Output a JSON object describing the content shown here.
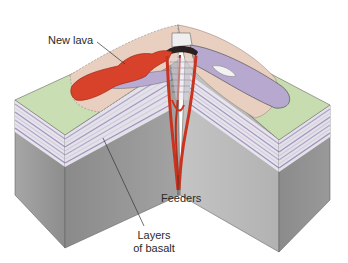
{
  "diagram": {
    "type": "block-diagram",
    "labels": {
      "new_lava": "New lava",
      "feeders": "Feeders",
      "layers_line1": "Layers",
      "layers_line2": "of basalt"
    },
    "colors": {
      "background": "#ffffff",
      "surface_tan": "#e9cfc0",
      "surface_green": "#c7ddb0",
      "old_flow_purple": "#b6a8cf",
      "new_lava_red": "#d8412a",
      "feeder_red": "#c8341f",
      "front_face_left": "#8f8f8f",
      "front_face_right": "#b4b4b4",
      "basalt_layer_light": "#ecebf0",
      "basalt_layer_purple": "#b9a8c8",
      "outline": "#555555"
    }
  }
}
